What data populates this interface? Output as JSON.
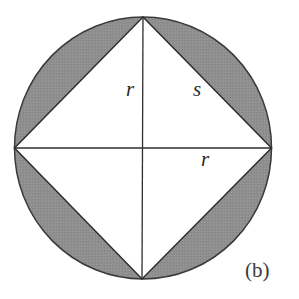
{
  "figure": {
    "caption": "(b)",
    "labels": {
      "vertical_radius": "r",
      "side": "s",
      "horizontal_radius": "r"
    },
    "colors": {
      "segment_fill": "#8e8e8e",
      "stroke": "#333333",
      "background": "#ffffff"
    }
  }
}
